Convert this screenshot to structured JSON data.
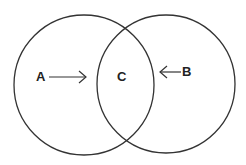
{
  "diagram": {
    "type": "venn",
    "sets": [
      {
        "id": "A",
        "label": "A"
      },
      {
        "id": "B",
        "label": "B"
      }
    ],
    "intersection": {
      "label": "C"
    },
    "arrows": [
      {
        "from": "A",
        "to": "C",
        "direction": "right"
      },
      {
        "from": "B",
        "to": "C",
        "direction": "left"
      }
    ],
    "stroke_color": "#333333"
  }
}
